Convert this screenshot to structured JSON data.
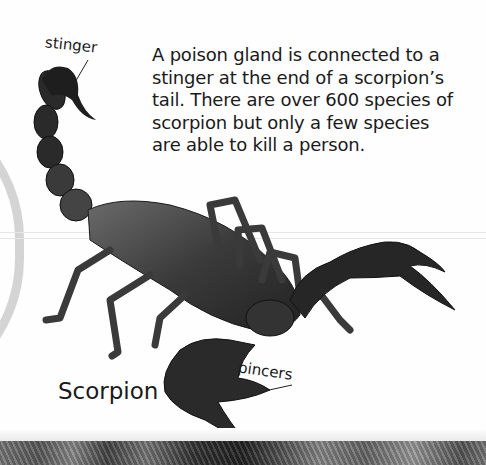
{
  "page": {
    "title": "Scorpion",
    "body_text": "A poison gland is connected to a stinger at the end of a scorpion's tail. There are over 600 species of scorpion but only a few species are able to kill a person.",
    "body_lines": [
      "A poison gland is connected to a",
      "stinger at the end of a scorpion’s",
      "tail. There are over 600 species of",
      "scorpion but only a few species",
      "are able to kill a person."
    ],
    "labels": {
      "stinger": "stinger",
      "pincers": "pincers"
    }
  },
  "image": {
    "subject": "scorpion-photo",
    "colors": {
      "background": "#fefefe",
      "text": "#1a1a1a",
      "scorpion_dark": "#1c1c1c",
      "scorpion_mid": "#555555",
      "arc": "#d4d4d4"
    }
  }
}
